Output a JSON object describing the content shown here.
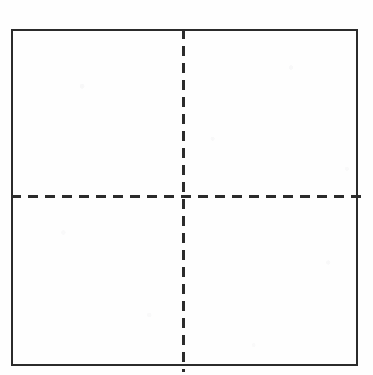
{
  "diagram": {
    "background_color": "#fefefe",
    "stroke_color": "#2b2b2b",
    "border": {
      "label": "Outer rectangle border",
      "x": 11,
      "y": 29,
      "width": 347,
      "height": 337,
      "stroke_width": 2,
      "style": "solid",
      "color": "#2b2b2b"
    },
    "divider_vertical": {
      "label": "Vertical dashed divider",
      "x": 183.5,
      "y_start": 29,
      "y_end": 372,
      "stroke_width": 3,
      "style": "dashed",
      "dash_length": 10,
      "gap_length": 7,
      "color": "#2b2b2b"
    },
    "divider_horizontal": {
      "label": "Horizontal dashed divider",
      "y": 196.5,
      "x_start": 11,
      "x_end": 366,
      "stroke_width": 3,
      "style": "dashed",
      "dash_length": 10,
      "gap_length": 7,
      "color": "#2b2b2b"
    },
    "quadrants": [
      {
        "name": "top-left-quadrant",
        "label": ""
      },
      {
        "name": "top-right-quadrant",
        "label": ""
      },
      {
        "name": "bottom-left-quadrant",
        "label": ""
      },
      {
        "name": "bottom-right-quadrant",
        "label": ""
      }
    ]
  },
  "canvas": {
    "width": 373,
    "height": 375
  }
}
